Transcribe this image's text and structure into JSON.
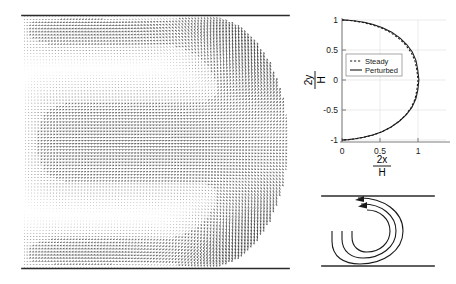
{
  "figure": {
    "title": "",
    "background_color": "#ffffff",
    "panels": [
      {
        "name": "velocity-vector-field",
        "position": "left"
      },
      {
        "name": "free-surface-shape-plot",
        "position": "top-right"
      },
      {
        "name": "flow-schematic",
        "position": "bottom-right"
      }
    ]
  },
  "vector_panel": {
    "name": "velocity-vector-field",
    "wall_top_label": "",
    "wall_bottom_label": "",
    "description": ""
  },
  "chart_data": [
    {
      "type": "line",
      "name": "free-surface-shape-plot",
      "title": "",
      "xlabel_numerator": "2x",
      "xlabel_denominator": "H",
      "ylabel_numerator": "2y",
      "ylabel_denominator": "H",
      "xlim": [
        -0.12,
        1.22
      ],
      "ylim": [
        -1.12,
        1.12
      ],
      "xticks": [
        0,
        0.5,
        1
      ],
      "xticklabels": [
        "0",
        "0.5",
        "1"
      ],
      "yticks": [
        -1,
        -0.5,
        0,
        0.5,
        1
      ],
      "yticklabels": [
        "-1",
        "-0.5",
        "0",
        "0.5",
        "1"
      ],
      "grid": true,
      "legend_position": "center-left",
      "series": [
        {
          "name": "Steady",
          "style": "dashed",
          "color": "#1a1a1a",
          "x": [
            0.0,
            0.08,
            0.17,
            0.28,
            0.4,
            0.52,
            0.64,
            0.75,
            0.84,
            0.91,
            0.96,
            0.985,
            1.0,
            0.985,
            0.96,
            0.91,
            0.84,
            0.75,
            0.64,
            0.52,
            0.4,
            0.28,
            0.17,
            0.08,
            0.0
          ],
          "y": [
            1.0,
            0.995,
            0.982,
            0.958,
            0.92,
            0.866,
            0.79,
            0.69,
            0.58,
            0.46,
            0.32,
            0.17,
            0.0,
            -0.17,
            -0.32,
            -0.46,
            -0.58,
            -0.69,
            -0.79,
            -0.866,
            -0.92,
            -0.958,
            -0.982,
            -0.995,
            -1.0
          ]
        },
        {
          "name": "Perturbed",
          "style": "solid",
          "color": "#1a1a1a",
          "x": [
            0.0,
            0.085,
            0.178,
            0.29,
            0.412,
            0.534,
            0.655,
            0.765,
            0.855,
            0.925,
            0.973,
            0.996,
            1.012,
            0.998,
            0.972,
            0.921,
            0.85,
            0.758,
            0.646,
            0.526,
            0.404,
            0.283,
            0.172,
            0.081,
            0.0
          ],
          "y": [
            1.0,
            0.996,
            0.984,
            0.961,
            0.924,
            0.871,
            0.797,
            0.698,
            0.587,
            0.468,
            0.327,
            0.175,
            0.004,
            -0.166,
            -0.314,
            -0.453,
            -0.573,
            -0.683,
            -0.784,
            -0.861,
            -0.916,
            -0.955,
            -0.98,
            -0.994,
            -1.0
          ]
        }
      ]
    }
  ],
  "surface_plot": {
    "legend": {
      "entries": [
        {
          "label": "Steady",
          "style": "dashed"
        },
        {
          "label": "Perturbed",
          "style": "solid"
        }
      ]
    },
    "xaxis": {
      "label_numerator": "2x",
      "label_denominator": "H",
      "ticklabels": [
        "0",
        "0.5",
        "1"
      ]
    },
    "yaxis": {
      "label_numerator": "2y",
      "label_denominator": "H",
      "ticklabels": [
        "1",
        "0.5",
        "0",
        "-0.5",
        "-1"
      ]
    }
  },
  "schematic": {
    "name": "flow-schematic",
    "caption": "",
    "walls": [
      "top-wall",
      "bottom-wall"
    ],
    "streamlines": 3,
    "arrowheads": 2
  }
}
